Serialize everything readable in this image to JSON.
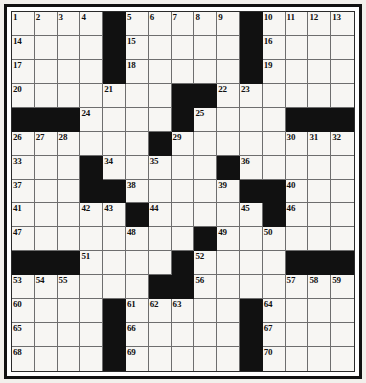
{
  "puzzle": {
    "title": "Crossword Puzzle Grid",
    "rows": 14,
    "cols": 14,
    "colors": {
      "block": "#111111",
      "cell": "#f7f6f3",
      "gridline": "#6e6e6e",
      "border": "#111111",
      "number_text": "#101010",
      "page_background": "#f2f0ec"
    },
    "clue_numbers_present": [
      1,
      2,
      3,
      4,
      5,
      6,
      7,
      8,
      9,
      10,
      11,
      12,
      13,
      14,
      15,
      16,
      17,
      18,
      19,
      20,
      21,
      22,
      23,
      24,
      25,
      26,
      27,
      28,
      29,
      30,
      31,
      32,
      33,
      34,
      35,
      36,
      37,
      38,
      39,
      40,
      41,
      42,
      43,
      44,
      45,
      46,
      47,
      48,
      49,
      50,
      51,
      52,
      53,
      54,
      55,
      56,
      57,
      58,
      59,
      60,
      61,
      62,
      63,
      64,
      65,
      66,
      67,
      68,
      69,
      70
    ],
    "grid": [
      [
        {
          "block": false,
          "num": "1"
        },
        {
          "block": false,
          "num": "2"
        },
        {
          "block": false,
          "num": "3"
        },
        {
          "block": false,
          "num": "4"
        },
        {
          "block": true,
          "num": ""
        },
        {
          "block": false,
          "num": "5"
        },
        {
          "block": false,
          "num": "6"
        },
        {
          "block": false,
          "num": "7"
        },
        {
          "block": false,
          "num": "8"
        },
        {
          "block": false,
          "num": "9"
        },
        {
          "block": true,
          "num": ""
        },
        {
          "block": false,
          "num": "10"
        },
        {
          "block": false,
          "num": "11"
        },
        {
          "block": false,
          "num": "12"
        },
        {
          "block": false,
          "num": "13"
        }
      ],
      [
        {
          "block": false,
          "num": "14"
        },
        {
          "block": false,
          "num": ""
        },
        {
          "block": false,
          "num": ""
        },
        {
          "block": false,
          "num": ""
        },
        {
          "block": true,
          "num": ""
        },
        {
          "block": false,
          "num": "15"
        },
        {
          "block": false,
          "num": ""
        },
        {
          "block": false,
          "num": ""
        },
        {
          "block": false,
          "num": ""
        },
        {
          "block": false,
          "num": ""
        },
        {
          "block": true,
          "num": ""
        },
        {
          "block": false,
          "num": "16"
        },
        {
          "block": false,
          "num": ""
        },
        {
          "block": false,
          "num": ""
        },
        {
          "block": false,
          "num": ""
        }
      ],
      [
        {
          "block": false,
          "num": "17"
        },
        {
          "block": false,
          "num": ""
        },
        {
          "block": false,
          "num": ""
        },
        {
          "block": false,
          "num": ""
        },
        {
          "block": true,
          "num": ""
        },
        {
          "block": false,
          "num": "18"
        },
        {
          "block": false,
          "num": ""
        },
        {
          "block": false,
          "num": ""
        },
        {
          "block": false,
          "num": ""
        },
        {
          "block": false,
          "num": ""
        },
        {
          "block": true,
          "num": ""
        },
        {
          "block": false,
          "num": "19"
        },
        {
          "block": false,
          "num": ""
        },
        {
          "block": false,
          "num": ""
        },
        {
          "block": false,
          "num": ""
        }
      ],
      [
        {
          "block": false,
          "num": "20"
        },
        {
          "block": false,
          "num": ""
        },
        {
          "block": false,
          "num": ""
        },
        {
          "block": false,
          "num": ""
        },
        {
          "block": false,
          "num": "21"
        },
        {
          "block": false,
          "num": ""
        },
        {
          "block": false,
          "num": ""
        },
        {
          "block": true,
          "num": ""
        },
        {
          "block": true,
          "num": ""
        },
        {
          "block": false,
          "num": "22"
        },
        {
          "block": false,
          "num": "23"
        },
        {
          "block": false,
          "num": ""
        },
        {
          "block": false,
          "num": ""
        },
        {
          "block": false,
          "num": ""
        },
        {
          "block": false,
          "num": ""
        }
      ],
      [
        {
          "block": true,
          "num": ""
        },
        {
          "block": true,
          "num": ""
        },
        {
          "block": true,
          "num": ""
        },
        {
          "block": false,
          "num": "24"
        },
        {
          "block": false,
          "num": ""
        },
        {
          "block": false,
          "num": ""
        },
        {
          "block": false,
          "num": ""
        },
        {
          "block": true,
          "num": ""
        },
        {
          "block": false,
          "num": "25"
        },
        {
          "block": false,
          "num": ""
        },
        {
          "block": false,
          "num": ""
        },
        {
          "block": false,
          "num": ""
        },
        {
          "block": true,
          "num": ""
        },
        {
          "block": true,
          "num": ""
        },
        {
          "block": true,
          "num": ""
        }
      ],
      [
        {
          "block": false,
          "num": "26"
        },
        {
          "block": false,
          "num": "27"
        },
        {
          "block": false,
          "num": "28"
        },
        {
          "block": false,
          "num": ""
        },
        {
          "block": false,
          "num": ""
        },
        {
          "block": false,
          "num": ""
        },
        {
          "block": true,
          "num": ""
        },
        {
          "block": false,
          "num": "29"
        },
        {
          "block": false,
          "num": ""
        },
        {
          "block": false,
          "num": ""
        },
        {
          "block": false,
          "num": ""
        },
        {
          "block": false,
          "num": ""
        },
        {
          "block": false,
          "num": "30"
        },
        {
          "block": false,
          "num": "31"
        },
        {
          "block": false,
          "num": "32"
        }
      ],
      [
        {
          "block": false,
          "num": "33"
        },
        {
          "block": false,
          "num": ""
        },
        {
          "block": false,
          "num": ""
        },
        {
          "block": true,
          "num": ""
        },
        {
          "block": false,
          "num": "34"
        },
        {
          "block": false,
          "num": ""
        },
        {
          "block": false,
          "num": "35"
        },
        {
          "block": false,
          "num": ""
        },
        {
          "block": false,
          "num": ""
        },
        {
          "block": true,
          "num": ""
        },
        {
          "block": false,
          "num": "36"
        },
        {
          "block": false,
          "num": ""
        },
        {
          "block": false,
          "num": ""
        },
        {
          "block": false,
          "num": ""
        },
        {
          "block": false,
          "num": ""
        }
      ],
      [
        {
          "block": false,
          "num": "37"
        },
        {
          "block": false,
          "num": ""
        },
        {
          "block": false,
          "num": ""
        },
        {
          "block": true,
          "num": ""
        },
        {
          "block": true,
          "num": ""
        },
        {
          "block": false,
          "num": "38"
        },
        {
          "block": false,
          "num": ""
        },
        {
          "block": false,
          "num": ""
        },
        {
          "block": false,
          "num": ""
        },
        {
          "block": false,
          "num": "39"
        },
        {
          "block": true,
          "num": ""
        },
        {
          "block": true,
          "num": ""
        },
        {
          "block": false,
          "num": "40"
        },
        {
          "block": false,
          "num": ""
        },
        {
          "block": false,
          "num": ""
        }
      ],
      [
        {
          "block": false,
          "num": "41"
        },
        {
          "block": false,
          "num": ""
        },
        {
          "block": false,
          "num": ""
        },
        {
          "block": false,
          "num": "42"
        },
        {
          "block": false,
          "num": "43"
        },
        {
          "block": true,
          "num": ""
        },
        {
          "block": false,
          "num": "44"
        },
        {
          "block": false,
          "num": ""
        },
        {
          "block": false,
          "num": ""
        },
        {
          "block": false,
          "num": ""
        },
        {
          "block": false,
          "num": "45"
        },
        {
          "block": true,
          "num": ""
        },
        {
          "block": false,
          "num": "46"
        },
        {
          "block": false,
          "num": ""
        },
        {
          "block": false,
          "num": ""
        }
      ],
      [
        {
          "block": false,
          "num": "47"
        },
        {
          "block": false,
          "num": ""
        },
        {
          "block": false,
          "num": ""
        },
        {
          "block": false,
          "num": ""
        },
        {
          "block": false,
          "num": ""
        },
        {
          "block": false,
          "num": "48"
        },
        {
          "block": false,
          "num": ""
        },
        {
          "block": false,
          "num": ""
        },
        {
          "block": true,
          "num": ""
        },
        {
          "block": false,
          "num": "49"
        },
        {
          "block": false,
          "num": ""
        },
        {
          "block": false,
          "num": "50"
        },
        {
          "block": false,
          "num": ""
        },
        {
          "block": false,
          "num": ""
        },
        {
          "block": false,
          "num": ""
        }
      ],
      [
        {
          "block": true,
          "num": ""
        },
        {
          "block": true,
          "num": ""
        },
        {
          "block": true,
          "num": ""
        },
        {
          "block": false,
          "num": "51"
        },
        {
          "block": false,
          "num": ""
        },
        {
          "block": false,
          "num": ""
        },
        {
          "block": false,
          "num": ""
        },
        {
          "block": true,
          "num": ""
        },
        {
          "block": false,
          "num": "52"
        },
        {
          "block": false,
          "num": ""
        },
        {
          "block": false,
          "num": ""
        },
        {
          "block": false,
          "num": ""
        },
        {
          "block": true,
          "num": ""
        },
        {
          "block": true,
          "num": ""
        },
        {
          "block": true,
          "num": ""
        }
      ],
      [
        {
          "block": false,
          "num": "53"
        },
        {
          "block": false,
          "num": "54"
        },
        {
          "block": false,
          "num": "55"
        },
        {
          "block": false,
          "num": ""
        },
        {
          "block": false,
          "num": ""
        },
        {
          "block": false,
          "num": ""
        },
        {
          "block": true,
          "num": ""
        },
        {
          "block": true,
          "num": ""
        },
        {
          "block": false,
          "num": "56"
        },
        {
          "block": false,
          "num": ""
        },
        {
          "block": false,
          "num": ""
        },
        {
          "block": false,
          "num": ""
        },
        {
          "block": false,
          "num": "57"
        },
        {
          "block": false,
          "num": "58"
        },
        {
          "block": false,
          "num": "59"
        }
      ],
      [
        {
          "block": false,
          "num": "60"
        },
        {
          "block": false,
          "num": ""
        },
        {
          "block": false,
          "num": ""
        },
        {
          "block": false,
          "num": ""
        },
        {
          "block": true,
          "num": ""
        },
        {
          "block": false,
          "num": "61"
        },
        {
          "block": false,
          "num": "62"
        },
        {
          "block": false,
          "num": "63"
        },
        {
          "block": false,
          "num": ""
        },
        {
          "block": false,
          "num": ""
        },
        {
          "block": true,
          "num": ""
        },
        {
          "block": false,
          "num": "64"
        },
        {
          "block": false,
          "num": ""
        },
        {
          "block": false,
          "num": ""
        },
        {
          "block": false,
          "num": ""
        }
      ],
      [
        {
          "block": false,
          "num": "65"
        },
        {
          "block": false,
          "num": ""
        },
        {
          "block": false,
          "num": ""
        },
        {
          "block": false,
          "num": ""
        },
        {
          "block": true,
          "num": ""
        },
        {
          "block": false,
          "num": "66"
        },
        {
          "block": false,
          "num": ""
        },
        {
          "block": false,
          "num": ""
        },
        {
          "block": false,
          "num": ""
        },
        {
          "block": false,
          "num": ""
        },
        {
          "block": true,
          "num": ""
        },
        {
          "block": false,
          "num": "67"
        },
        {
          "block": false,
          "num": ""
        },
        {
          "block": false,
          "num": ""
        },
        {
          "block": false,
          "num": ""
        }
      ],
      [
        {
          "block": false,
          "num": "68"
        },
        {
          "block": false,
          "num": ""
        },
        {
          "block": false,
          "num": ""
        },
        {
          "block": false,
          "num": ""
        },
        {
          "block": true,
          "num": ""
        },
        {
          "block": false,
          "num": "69"
        },
        {
          "block": false,
          "num": ""
        },
        {
          "block": false,
          "num": ""
        },
        {
          "block": false,
          "num": ""
        },
        {
          "block": false,
          "num": ""
        },
        {
          "block": true,
          "num": ""
        },
        {
          "block": false,
          "num": "70"
        },
        {
          "block": false,
          "num": ""
        },
        {
          "block": false,
          "num": ""
        },
        {
          "block": false,
          "num": ""
        }
      ]
    ]
  }
}
